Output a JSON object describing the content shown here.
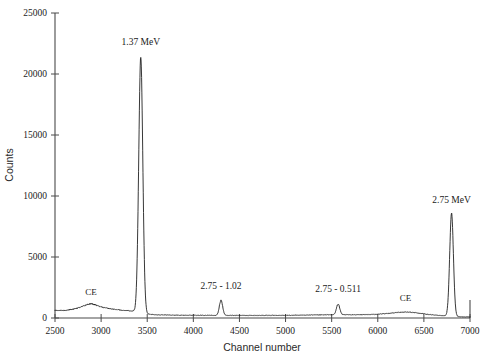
{
  "chart_data": {
    "type": "line",
    "title": "",
    "xlabel": "Channel number",
    "ylabel": "Counts",
    "xlim": [
      2500,
      7000
    ],
    "ylim": [
      0,
      25000
    ],
    "grid": false,
    "legend": "none",
    "xticks": [
      2500,
      3000,
      3500,
      4000,
      4500,
      5000,
      5500,
      6000,
      6500,
      7000
    ],
    "xtick_labels": [
      "2500",
      "3000",
      "3500",
      "4000",
      "4500",
      "5000",
      "5500",
      "6000",
      "6500",
      "7000"
    ],
    "yticks": [
      0,
      5000,
      10000,
      15000,
      20000,
      25000
    ],
    "ytick_labels": [
      "0",
      "5000",
      "10000",
      "15000",
      "20000",
      "25000"
    ],
    "annotations": [
      {
        "text": "1.37 MeV",
        "x": 3430,
        "y": 22400,
        "kind": "photopeak-label"
      },
      {
        "text": "2.75 - 1.02",
        "x": 4300,
        "y": 2350,
        "kind": "double-escape-label"
      },
      {
        "text": "2.75 - 0.511",
        "x": 5570,
        "y": 2150,
        "kind": "single-escape-label"
      },
      {
        "text": "2.75 MeV",
        "x": 6800,
        "y": 9400,
        "kind": "photopeak-label"
      },
      {
        "text": "CE",
        "x": 2890,
        "y": 1850,
        "kind": "compton-edge-label"
      },
      {
        "text": "CE",
        "x": 6300,
        "y": 1400,
        "kind": "compton-edge-label"
      }
    ],
    "peaks": [
      {
        "name": "1.37 MeV photopeak",
        "channel": 3430,
        "counts": 21400,
        "width": 22
      },
      {
        "name": "2.75 - 1.02 MeV double escape",
        "channel": 4300,
        "counts": 1450,
        "width": 18
      },
      {
        "name": "2.75 - 0.511 MeV single escape",
        "channel": 5570,
        "counts": 1150,
        "width": 18
      },
      {
        "name": "2.75 MeV photopeak",
        "channel": 6800,
        "counts": 8600,
        "width": 20
      }
    ],
    "continuum": [
      [
        2500,
        640
      ],
      [
        2560,
        620
      ],
      [
        2620,
        640
      ],
      [
        2680,
        700
      ],
      [
        2740,
        800
      ],
      [
        2800,
        950
      ],
      [
        2840,
        1080
      ],
      [
        2875,
        1160
      ],
      [
        2905,
        1150
      ],
      [
        2940,
        1060
      ],
      [
        2990,
        930
      ],
      [
        3050,
        820
      ],
      [
        3120,
        740
      ],
      [
        3200,
        660
      ],
      [
        3280,
        600
      ],
      [
        3350,
        560
      ],
      [
        3400,
        540
      ],
      [
        3430,
        530
      ],
      [
        3460,
        450
      ],
      [
        3500,
        330
      ],
      [
        3560,
        280
      ],
      [
        3650,
        255
      ],
      [
        3760,
        240
      ],
      [
        3880,
        230
      ],
      [
        4000,
        225
      ],
      [
        4150,
        220
      ],
      [
        4300,
        215
      ],
      [
        4450,
        212
      ],
      [
        4600,
        210
      ],
      [
        4750,
        212
      ],
      [
        4900,
        218
      ],
      [
        5050,
        228
      ],
      [
        5200,
        240
      ],
      [
        5350,
        252
      ],
      [
        5500,
        262
      ],
      [
        5570,
        266
      ],
      [
        5640,
        268
      ],
      [
        5720,
        262
      ],
      [
        5800,
        262
      ],
      [
        5900,
        280
      ],
      [
        6000,
        315
      ],
      [
        6100,
        370
      ],
      [
        6180,
        430
      ],
      [
        6260,
        480
      ],
      [
        6320,
        490
      ],
      [
        6380,
        455
      ],
      [
        6450,
        390
      ],
      [
        6520,
        320
      ],
      [
        6600,
        255
      ],
      [
        6680,
        205
      ],
      [
        6760,
        175
      ],
      [
        6800,
        168
      ],
      [
        6860,
        120
      ],
      [
        6920,
        95
      ],
      [
        7000,
        85
      ]
    ],
    "series_name": "counts-per-channel"
  },
  "axes": {
    "y_axis_title": "Counts",
    "x_axis_title": "Channel number"
  }
}
